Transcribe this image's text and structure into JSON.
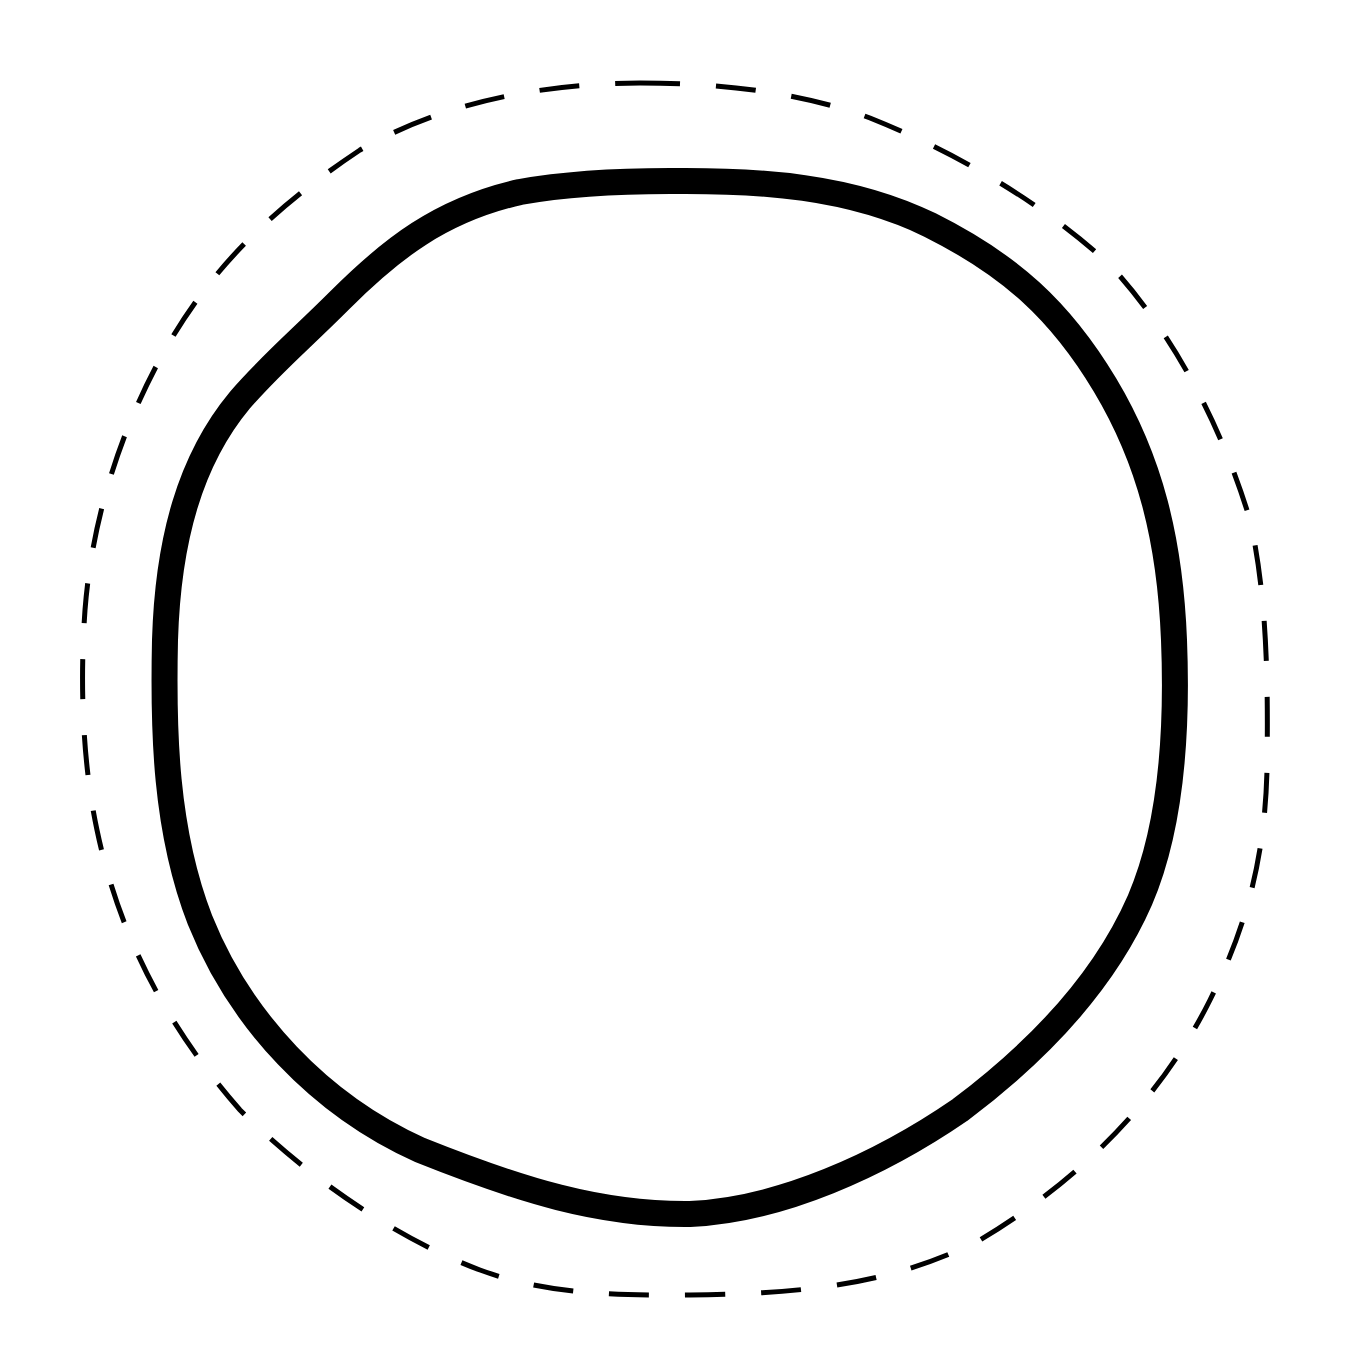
{
  "diagram": {
    "background": "#ffffff",
    "shapes": [
      {
        "id": "inner-shape",
        "kind": "closed-irregular-circle",
        "line_style": "solid",
        "stroke_color": "#000000",
        "stroke_width": 26,
        "path": "M 670 181 C 760 180, 850 186, 930 225 C 1010 265, 1060 310, 1105 385 C 1150 460, 1170 540, 1174 640 C 1178 740, 1170 830, 1140 900 C 1105 980, 1040 1050, 960 1110 C 880 1165, 780 1210, 690 1214 C 600 1215, 520 1190, 420 1150 C 320 1105, 240 1020, 200 920 C 165 830, 163 730, 165 640 C 168 540, 190 460, 240 400 C 270 365, 300 340, 340 300 C 390 250, 440 210, 520 192 C 570 183, 620 181, 670 181 Z"
      },
      {
        "id": "outer-shape",
        "kind": "closed-irregular-circle",
        "line_style": "dashed",
        "stroke_color": "#000000",
        "stroke_width": 5,
        "dash_array": "40 36",
        "path": "M 640 83 C 720 83, 800 92, 870 118 C 950 150, 1040 200, 1110 265 C 1170 330, 1220 420, 1250 520 C 1268 600, 1268 690, 1267 770 C 1265 850, 1250 920, 1210 1000 C 1160 1100, 1080 1180, 980 1240 C 900 1280, 820 1294, 690 1295 C 600 1296, 540 1292, 480 1270 C 400 1240, 310 1180, 240 1110 C 170 1030, 120 940, 97 830 C 82 760, 80 680, 85 610 C 92 520, 120 430, 165 350 C 210 270, 270 210, 360 150 C 430 110, 520 84, 640 83 Z"
      }
    ]
  }
}
